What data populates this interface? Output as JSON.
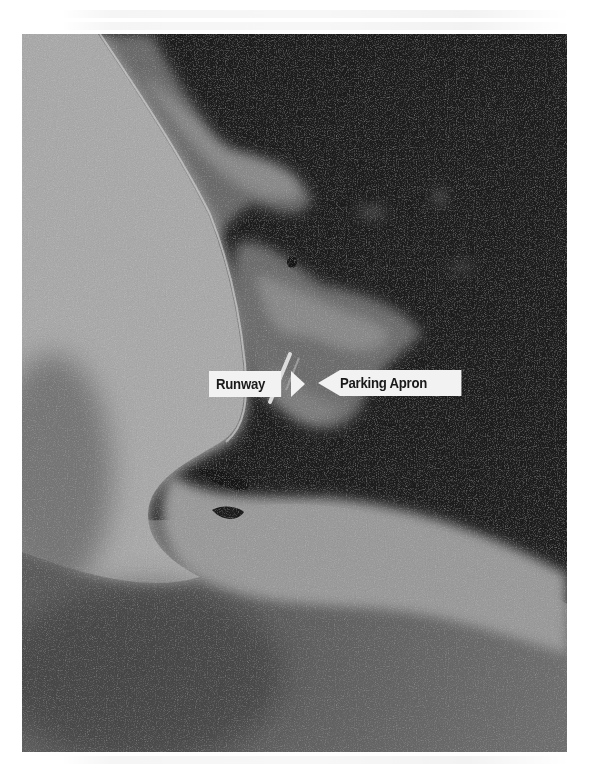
{
  "figure": {
    "type": "grayscale aerial/satellite photograph",
    "colors": {
      "page_background": "#ffffff",
      "water_dark": "#1e1e1e",
      "land_light": "#b8b8b8",
      "land_mid": "#7a7a7a",
      "label_fill": "#f2f2f2",
      "label_text": "#1a1a1a"
    }
  },
  "annotations": [
    {
      "id": "runway",
      "label": "Runway",
      "arrow_direction": "right"
    },
    {
      "id": "parking-apron",
      "label": "Parking Apron",
      "arrow_direction": "left"
    }
  ]
}
